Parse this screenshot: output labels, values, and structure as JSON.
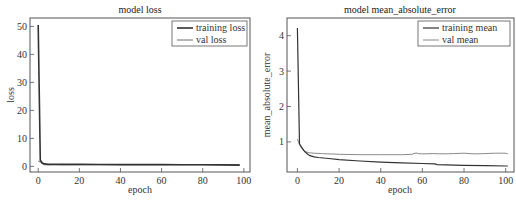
{
  "chart_data": [
    {
      "type": "line",
      "title": "model loss",
      "xlabel": "epoch",
      "ylabel": "loss",
      "xlim": [
        -4,
        103
      ],
      "ylim": [
        -2,
        53
      ],
      "xticks": [
        0,
        20,
        40,
        60,
        80,
        100
      ],
      "yticks": [
        0,
        10,
        20,
        30,
        40,
        50
      ],
      "grid": false,
      "legend_position": "upper right",
      "series": [
        {
          "name": "training loss",
          "color": "#333333",
          "width": 1.6,
          "x": [
            0,
            1,
            2,
            3,
            5,
            8,
            12,
            20,
            30,
            40,
            50,
            60,
            70,
            80,
            90,
            98
          ],
          "y": [
            50.5,
            2.2,
            1.2,
            0.9,
            0.8,
            0.75,
            0.72,
            0.7,
            0.68,
            0.66,
            0.64,
            0.63,
            0.6,
            0.57,
            0.52,
            0.48
          ]
        },
        {
          "name": "val loss",
          "color": "#6e6e6e",
          "width": 1.0,
          "x": [
            0,
            1,
            2,
            3,
            5,
            8,
            12,
            20,
            30,
            40,
            50,
            60,
            70,
            80,
            90,
            98
          ],
          "y": [
            1.9,
            1.5,
            1.0,
            0.6,
            0.5,
            0.55,
            0.58,
            0.6,
            0.6,
            0.62,
            0.6,
            0.62,
            0.6,
            0.6,
            0.58,
            0.6
          ]
        }
      ]
    },
    {
      "type": "line",
      "title": "model mean_absolute_error",
      "xlabel": "epoch",
      "ylabel": "mean_absolute_error",
      "xlim": [
        -5,
        104
      ],
      "ylim": [
        0.15,
        4.5
      ],
      "xticks": [
        0,
        20,
        40,
        60,
        80,
        100
      ],
      "yticks": [
        1,
        2,
        3,
        4
      ],
      "grid": false,
      "legend_position": "upper right",
      "series": [
        {
          "name": "training mean",
          "color": "#333333",
          "width": 1.2,
          "x": [
            0,
            1,
            2,
            3,
            4,
            5,
            6,
            8,
            10,
            15,
            20,
            30,
            40,
            50,
            60,
            66,
            67,
            80,
            90,
            100,
            101
          ],
          "y": [
            4.22,
            0.95,
            0.85,
            0.76,
            0.7,
            0.65,
            0.61,
            0.58,
            0.56,
            0.53,
            0.5,
            0.46,
            0.43,
            0.41,
            0.39,
            0.38,
            0.36,
            0.34,
            0.33,
            0.32,
            0.32
          ]
        },
        {
          "name": "val mean",
          "color": "#8a8a8a",
          "width": 1.0,
          "x": [
            0,
            1,
            2,
            4,
            6,
            8,
            12,
            20,
            30,
            40,
            50,
            55,
            57,
            58,
            60,
            65,
            70,
            75,
            80,
            85,
            90,
            95,
            100,
            101
          ],
          "y": [
            1.08,
            0.92,
            0.82,
            0.72,
            0.69,
            0.68,
            0.67,
            0.65,
            0.64,
            0.64,
            0.64,
            0.65,
            0.69,
            0.67,
            0.66,
            0.67,
            0.66,
            0.67,
            0.68,
            0.66,
            0.67,
            0.68,
            0.68,
            0.66
          ]
        }
      ]
    }
  ],
  "charts": [
    {
      "title": "model loss",
      "xlabel": "epoch",
      "ylabel": "loss",
      "legend": [
        "training loss",
        "val loss"
      ]
    },
    {
      "title": "model mean_absolute_error",
      "xlabel": "epoch",
      "ylabel": "mean_absolute_error",
      "legend": [
        "training mean",
        "val mean"
      ]
    }
  ],
  "colors": {
    "axis": "#555555",
    "background": "#ffffff"
  }
}
